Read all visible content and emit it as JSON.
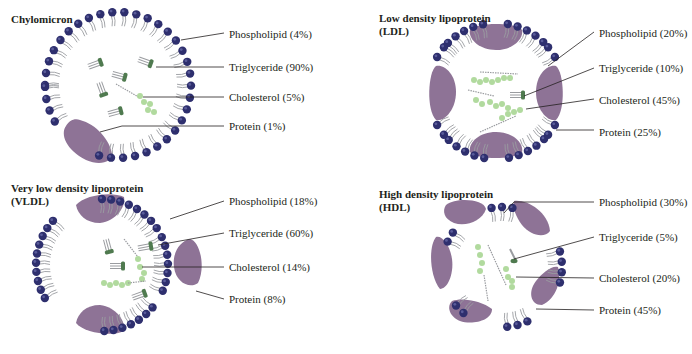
{
  "colors": {
    "phospholipid_head": "#2e2f6e",
    "phospholipid_tail": "#9a9ca0",
    "protein": "#8e7396",
    "cholesterol": "#a9d693",
    "triglyceride_head": "#4f7a4f",
    "leader_line": "#231f20"
  },
  "panels": [
    {
      "id": "chylomicron",
      "title_line1": "Chylomicron",
      "title_line2": "",
      "labels": {
        "phospholipid": "Phospholipid (4%)",
        "triglyceride": "Triglyceride (90%)",
        "cholesterol": "Cholesterol (5%)",
        "protein": "Protein (1%)"
      }
    },
    {
      "id": "ldl",
      "title_line1": "Low density lipoprotein",
      "title_line2": "(LDL)",
      "labels": {
        "phospholipid": "Phospholipid (20%)",
        "triglyceride": "Triglyceride (10%)",
        "cholesterol": "Cholesterol (45%)",
        "protein": "Protein (25%)"
      }
    },
    {
      "id": "vldl",
      "title_line1": "Very low density lipoprotein",
      "title_line2": "(VLDL)",
      "labels": {
        "phospholipid": "Phospholipid (18%)",
        "triglyceride": "Triglyceride (60%)",
        "cholesterol": "Cholesterol (14%)",
        "protein": "Protein (8%)"
      }
    },
    {
      "id": "hdl",
      "title_line1": "High density lipoprotein",
      "title_line2": "(HDL)",
      "labels": {
        "phospholipid": "Phospholipid (30%)",
        "triglyceride": "Triglyceride (5%)",
        "cholesterol": "Cholesterol (20%)",
        "protein": "Protein (45%)"
      }
    }
  ]
}
